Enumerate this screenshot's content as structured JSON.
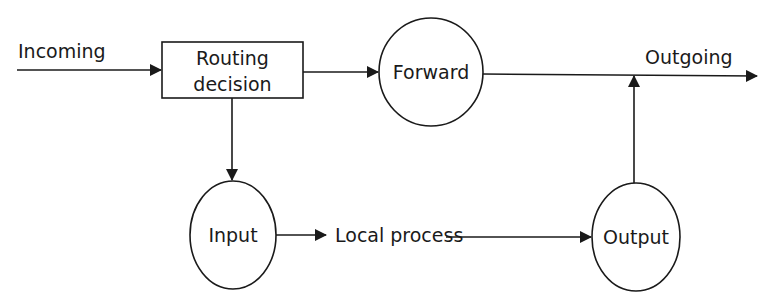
{
  "diagram": {
    "type": "flow",
    "nodes": [
      {
        "id": "routing",
        "shape": "rectangle",
        "label_lines": [
          "Routing",
          "decision"
        ]
      },
      {
        "id": "forward",
        "shape": "circle",
        "label": "Forward"
      },
      {
        "id": "input",
        "shape": "circle",
        "label": "Input"
      },
      {
        "id": "output",
        "shape": "circle",
        "label": "Output"
      }
    ],
    "edge_labels": {
      "incoming": "Incoming",
      "outgoing": "Outgoing",
      "local_process": "Local process"
    },
    "edges": [
      {
        "from": "incoming",
        "to": "routing"
      },
      {
        "from": "routing",
        "to": "forward"
      },
      {
        "from": "forward",
        "to": "outgoing"
      },
      {
        "from": "routing",
        "to": "input"
      },
      {
        "from": "input",
        "to": "local_process"
      },
      {
        "from": "local_process",
        "to": "output"
      },
      {
        "from": "output",
        "to": "outgoing"
      }
    ]
  }
}
